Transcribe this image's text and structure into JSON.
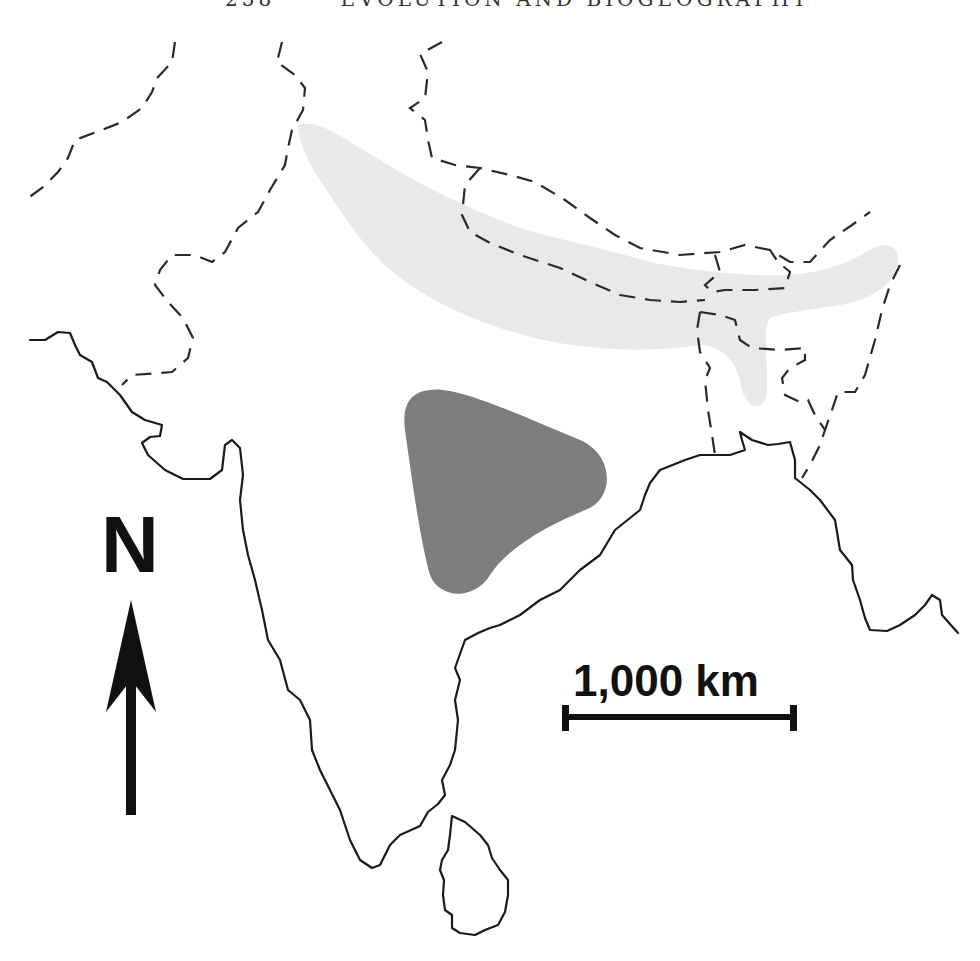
{
  "page_header": {
    "page_number": "258",
    "running_title": "EVOLUTION AND BIOGEOGRAPHY"
  },
  "map": {
    "region": "Indian subcontinent",
    "north_arrow": {
      "label": "N",
      "icon": "north-arrow-icon"
    },
    "scale_bar": {
      "label": "1,000 km"
    },
    "areas": [
      {
        "id": "himalayan-range",
        "description": "Light gray band along the Himalaya from northwest to the northeast",
        "fill": "#e9e9e9"
      },
      {
        "id": "central-india-range",
        "description": "Dark gray rounded triangle in central India",
        "fill": "#7d7d7d"
      }
    ],
    "line_styles": {
      "coastline": "solid black",
      "political_borders": "dashed black"
    },
    "colors": {
      "background": "#ffffff",
      "ink": "#1a1a1a",
      "light_range": "#e9e9e9",
      "dark_range": "#7d7d7d"
    }
  }
}
